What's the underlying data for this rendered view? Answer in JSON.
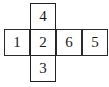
{
  "figure": {
    "shape": "cross",
    "grid": {
      "cols": 4,
      "rows": 3,
      "cell_width": 26,
      "cell_height": 27
    },
    "stroke_color": "#2b2b2b",
    "fill_color": "#ffffff",
    "text_color": "#1b1b1b"
  },
  "cells": [
    {
      "id": "top",
      "row": 0,
      "col": 1,
      "label": "4"
    },
    {
      "id": "middle-left",
      "row": 1,
      "col": 0,
      "label": "1"
    },
    {
      "id": "middle-center",
      "row": 1,
      "col": 1,
      "label": "2"
    },
    {
      "id": "middle-right",
      "row": 1,
      "col": 2,
      "label": "6"
    },
    {
      "id": "middle-far-right",
      "row": 1,
      "col": 3,
      "label": "5"
    },
    {
      "id": "bottom",
      "row": 2,
      "col": 1,
      "label": "3"
    }
  ]
}
